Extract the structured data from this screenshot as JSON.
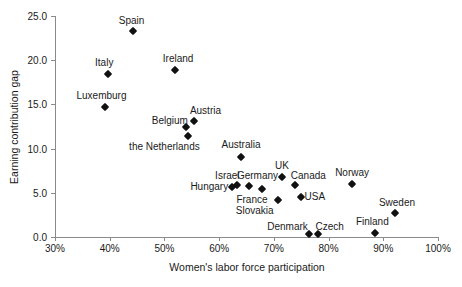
{
  "chart_data": {
    "type": "scatter",
    "title": "",
    "xlabel": "Women's labor force participation",
    "ylabel": "Earning contribution gap",
    "xlim": [
      30,
      100
    ],
    "ylim": [
      0,
      25
    ],
    "xticks": [
      "30%",
      "40%",
      "50%",
      "60%",
      "70%",
      "80%",
      "90%",
      "100%"
    ],
    "xtick_values": [
      30,
      40,
      50,
      60,
      70,
      80,
      90,
      100
    ],
    "yticks": [
      "0.0",
      "5.0",
      "10.0",
      "15.0",
      "20.0",
      "25.0"
    ],
    "ytick_values": [
      0,
      5,
      10,
      15,
      20,
      25
    ],
    "grid": false,
    "legend": "none",
    "marker": "diamond",
    "marker_color": "#111111",
    "points": [
      {
        "label": "Spain",
        "x": 44.2,
        "y": 23.3,
        "lx": 44.0,
        "ly": 24.6
      },
      {
        "label": "Italy",
        "x": 39.7,
        "y": 18.4,
        "lx": 39.0,
        "ly": 19.8
      },
      {
        "label": "Ireland",
        "x": 52.0,
        "y": 18.9,
        "lx": 52.5,
        "ly": 20.3
      },
      {
        "label": "Luxemburg",
        "x": 39.2,
        "y": 14.7,
        "lx": 38.5,
        "ly": 16.1
      },
      {
        "label": "Austria",
        "x": 55.4,
        "y": 13.1,
        "lx": 57.5,
        "ly": 14.4
      },
      {
        "label": "Belgium",
        "x": 53.9,
        "y": 12.4,
        "lx": 51.0,
        "ly": 13.2
      },
      {
        "label": "the Netherlands",
        "x": 54.3,
        "y": 11.4,
        "lx": 50.0,
        "ly": 10.3
      },
      {
        "label": "Australia",
        "x": 64.0,
        "y": 9.1,
        "lx": 64.0,
        "ly": 10.5
      },
      {
        "label": "Israel",
        "x": 63.3,
        "y": 5.9,
        "lx": 61.5,
        "ly": 7.0
      },
      {
        "label": "Germany",
        "x": 65.5,
        "y": 5.8,
        "lx": 67.0,
        "ly": 7.0
      },
      {
        "label": "Hungary",
        "x": 62.4,
        "y": 5.7,
        "lx": 58.2,
        "ly": 5.8
      },
      {
        "label": "UK",
        "x": 71.5,
        "y": 6.8,
        "lx": 71.5,
        "ly": 8.2
      },
      {
        "label": "Canada",
        "x": 73.9,
        "y": 5.9,
        "lx": 76.3,
        "ly": 7.0
      },
      {
        "label": "France",
        "x": 67.8,
        "y": 5.4,
        "lx": 66.0,
        "ly": 4.3
      },
      {
        "label": "USA",
        "x": 75.0,
        "y": 4.5,
        "lx": 77.5,
        "ly": 4.6
      },
      {
        "label": "Slovakia",
        "x": 70.8,
        "y": 4.2,
        "lx": 66.5,
        "ly": 3.1
      },
      {
        "label": "Norway",
        "x": 84.3,
        "y": 6.0,
        "lx": 84.3,
        "ly": 7.4
      },
      {
        "label": "Sweden",
        "x": 92.2,
        "y": 2.7,
        "lx": 92.5,
        "ly": 4.0
      },
      {
        "label": "Finland",
        "x": 88.5,
        "y": 0.5,
        "lx": 88.0,
        "ly": 1.8
      },
      {
        "label": "Denmark",
        "x": 76.5,
        "y": 0.3,
        "lx": 72.5,
        "ly": 1.3
      },
      {
        "label": "Czech",
        "x": 78.1,
        "y": 0.3,
        "lx": 80.2,
        "ly": 1.3
      }
    ]
  }
}
